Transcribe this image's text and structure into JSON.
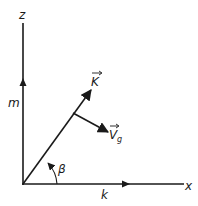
{
  "diagram": {
    "axes": {
      "z_label": "z",
      "x_label": "x",
      "z_component_label": "m",
      "x_component_label": "k"
    },
    "vectors": {
      "wave_vector_label": "K",
      "group_velocity_label": "V",
      "group_velocity_subscript": "g"
    },
    "angle_label": "β",
    "colors": {
      "line": "#1a1a1a",
      "background": "#ffffff"
    }
  }
}
